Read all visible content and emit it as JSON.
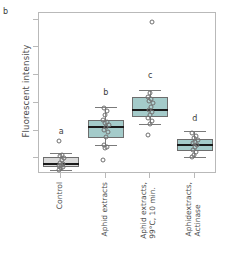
{
  "figure": {
    "panel_label": "b",
    "background": "#ffffff",
    "panel_border_color": "#b9b9b9"
  },
  "chart_data": {
    "type": "box",
    "title": "",
    "xlabel": "",
    "ylabel": "Fluorescent intensity",
    "ylim": [
      0.72,
      3.62
    ],
    "yticks": [
      1.0,
      1.5,
      2.0,
      2.5,
      3.0,
      3.5
    ],
    "ytick_labels": [
      "1.0",
      "1.5",
      "2.0",
      "2.5",
      "3.0",
      "3.5"
    ],
    "grid": false,
    "legend": "none",
    "categories": [
      "Control",
      "Aphid extracts",
      "Aphid extracts, 99°C, 10 min.",
      "Aphidextracts, Actinase"
    ],
    "category_labels": [
      {
        "line1": "Control",
        "line2": ""
      },
      {
        "line1": "Aphid extracts",
        "line2": ""
      },
      {
        "line1": "Aphid extracts,",
        "line2": "99°C, 10 min."
      },
      {
        "line1": "Aphidextracts,",
        "line2": "Actinase"
      }
    ],
    "significance_letters": [
      "a",
      "b",
      "c",
      "d"
    ],
    "box_colors": [
      "#d9d9d9",
      "#a4cbca",
      "#a4cbca",
      "#a4cbca"
    ],
    "boxes": [
      {
        "category": "Control",
        "letter": "a",
        "letter_y": 1.4,
        "fill": "#d9d9d9",
        "whisker_low": 0.8,
        "q1": 0.845,
        "median": 0.9,
        "q3": 1.02,
        "whisker_high": 1.1,
        "points": [
          0.8,
          0.82,
          0.84,
          0.86,
          0.88,
          0.9,
          0.92,
          0.97,
          1.01,
          1.04,
          1.07,
          1.31
        ]
      },
      {
        "category": "Aphid extracts",
        "letter": "b",
        "letter_y": 2.1,
        "fill": "#a4cbca",
        "whisker_low": 1.25,
        "q1": 1.375,
        "median": 1.57,
        "q3": 1.7,
        "whisker_high": 1.92,
        "points": [
          0.97,
          1.19,
          1.21,
          1.24,
          1.38,
          1.47,
          1.52,
          1.57,
          1.6,
          1.63,
          1.66,
          1.7,
          1.78,
          1.86,
          1.9
        ]
      },
      {
        "category": "Aphid extracts, 99°C, 10 min.",
        "letter": "c",
        "letter_y": 2.42,
        "fill": "#a4cbca",
        "whisker_low": 1.62,
        "q1": 1.745,
        "median": 1.88,
        "q3": 2.1,
        "whisker_high": 2.24,
        "points": [
          1.43,
          1.62,
          1.68,
          1.72,
          1.78,
          1.84,
          1.88,
          1.92,
          1.99,
          2.03,
          2.07,
          2.11,
          2.18,
          3.45
        ]
      },
      {
        "category": "Aphidextracts, Actinase",
        "letter": "d",
        "letter_y": 1.63,
        "fill": "#a4cbca",
        "whisker_low": 1.02,
        "q1": 1.135,
        "median": 1.24,
        "q3": 1.355,
        "whisker_high": 1.5,
        "points": [
          1.02,
          1.06,
          1.12,
          1.16,
          1.2,
          1.24,
          1.27,
          1.3,
          1.33,
          1.37,
          1.41,
          1.46
        ]
      }
    ]
  }
}
